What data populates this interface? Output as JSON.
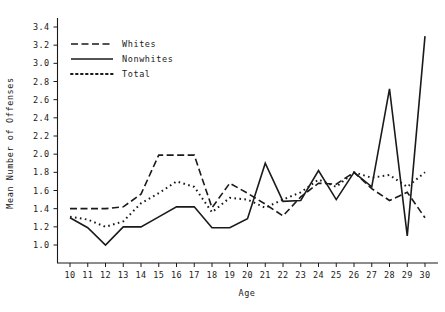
{
  "chart_data": {
    "type": "line",
    "title": "",
    "xlabel": "Age",
    "ylabel": "Mean Number of Offenses",
    "x": [
      10,
      11,
      12,
      13,
      14,
      15,
      16,
      17,
      18,
      19,
      20,
      21,
      22,
      23,
      24,
      25,
      26,
      27,
      28,
      29,
      30
    ],
    "xtick_labels": [
      "10",
      "11",
      "12",
      "13",
      "14",
      "15",
      "16",
      "17",
      "18",
      "19",
      "20",
      "21",
      "22",
      "23",
      "24",
      "25",
      "26",
      "27",
      "28",
      "29",
      "30"
    ],
    "ytick_labels": [
      "1.0",
      "1.2",
      "1.4",
      "1.6",
      "1.8",
      "2.0",
      "2.2",
      "2.4",
      "2.6",
      "2.8",
      "3.0",
      "3.2",
      "3.4"
    ],
    "ytick_values": [
      1.0,
      1.2,
      1.4,
      1.6,
      1.8,
      2.0,
      2.2,
      2.4,
      2.6,
      2.8,
      3.0,
      3.2,
      3.4
    ],
    "ylim": [
      0.9,
      3.5
    ],
    "xlim": [
      10,
      30
    ],
    "grid": false,
    "legend_position": "upper-left",
    "series": [
      {
        "name": "Whites",
        "style": "dashed",
        "color": "#1a1a1a",
        "values": [
          1.4,
          1.4,
          1.4,
          1.42,
          1.56,
          1.99,
          1.99,
          1.99,
          1.41,
          1.68,
          1.57,
          1.45,
          1.32,
          1.53,
          1.68,
          1.67,
          1.8,
          1.62,
          1.49,
          1.58,
          1.3
        ]
      },
      {
        "name": "Nonwhites",
        "style": "solid",
        "color": "#1a1a1a",
        "values": [
          1.3,
          1.19,
          1.0,
          1.2,
          1.2,
          1.31,
          1.42,
          1.42,
          1.19,
          1.19,
          1.29,
          1.9,
          1.48,
          1.49,
          1.82,
          1.5,
          1.8,
          1.64,
          2.72,
          1.1,
          3.3
        ]
      },
      {
        "name": "Total",
        "style": "dotted",
        "color": "#1a1a1a",
        "values": [
          1.31,
          1.28,
          1.2,
          1.26,
          1.46,
          1.57,
          1.7,
          1.64,
          1.36,
          1.52,
          1.5,
          1.41,
          1.5,
          1.58,
          1.72,
          1.64,
          1.8,
          1.74,
          1.77,
          1.64,
          1.8
        ]
      }
    ],
    "legend_entries": [
      {
        "label": "Whites",
        "style": "dashed"
      },
      {
        "label": "Nonwhites",
        "style": "solid"
      },
      {
        "label": "Total",
        "style": "dotted"
      }
    ]
  }
}
